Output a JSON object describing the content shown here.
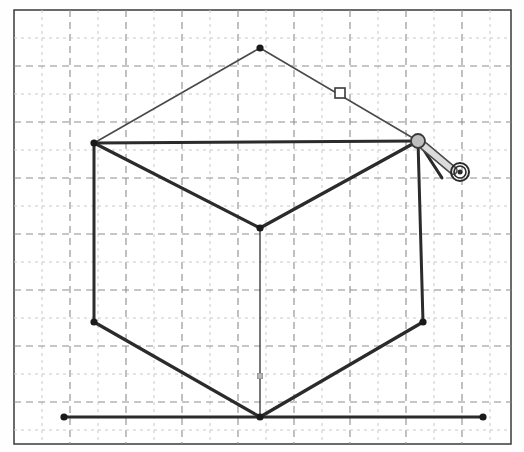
{
  "app": {
    "title": "Isometric Cube Sketch",
    "background_color": "#fefefe",
    "width": 524,
    "height": 452
  },
  "frame": {
    "name": "drawing-frame",
    "x": 14,
    "y": 10,
    "width": 497,
    "height": 434,
    "border_color": "#3a3a3a",
    "border_width": 1.5,
    "fill": "#ffffff"
  },
  "grid": {
    "minor_spacing": 28,
    "major_spacing": 56,
    "minor_color": "#c9c9c9",
    "major_color": "#8d8d8d",
    "minor_dash": "3 4",
    "major_dash": "7 5",
    "visible": true
  },
  "colors": {
    "stroke_heavy": "#2b2b2b",
    "stroke_light": "#4a4a4a",
    "vertex_fill": "#1a1a1a",
    "handle_fill": "#ffffff",
    "handle_stroke": "#3a3a3a",
    "cursor_body": "#dcdcdc",
    "cursor_outline": "#4a4a4a",
    "midpoint_marker": "#9a9a9a"
  },
  "chart_data": {
    "type": "scatter",
    "xlabel": "",
    "ylabel": "",
    "xlim": [
      0,
      524
    ],
    "ylim": [
      0,
      452
    ],
    "grid": true,
    "legend": "none",
    "vertices": [
      {
        "id": "apex",
        "label": "Top Apex",
        "x": 260,
        "y": 48,
        "dot": true
      },
      {
        "id": "left",
        "label": "Left Upper",
        "x": 94,
        "y": 143,
        "dot": true
      },
      {
        "id": "right",
        "label": "Right Upper",
        "x": 418,
        "y": 141,
        "dot": true
      },
      {
        "id": "center",
        "label": "Center Front",
        "x": 260,
        "y": 228,
        "dot": true
      },
      {
        "id": "bottom-left",
        "label": "Bottom Left",
        "x": 94,
        "y": 322,
        "dot": true
      },
      {
        "id": "bottom-right",
        "label": "Bottom Right",
        "x": 423,
        "y": 322,
        "dot": true
      },
      {
        "id": "bottom-center",
        "label": "Bottom Center",
        "x": 260,
        "y": 417,
        "dot": true
      },
      {
        "id": "base-left",
        "label": "Baseline Left",
        "x": 64,
        "y": 417,
        "dot": true
      },
      {
        "id": "base-right",
        "label": "Baseline Right",
        "x": 483,
        "y": 417,
        "dot": true
      }
    ],
    "edges": [
      {
        "id": "apex-left",
        "from": "apex",
        "to": "left",
        "weight": "light",
        "width": 1.6
      },
      {
        "id": "apex-right",
        "from": "apex",
        "to": "right",
        "weight": "light",
        "width": 1.6
      },
      {
        "id": "left-right",
        "from": "left",
        "to": "right",
        "weight": "heavy",
        "width": 3.2
      },
      {
        "id": "left-center",
        "from": "left",
        "to": "center",
        "weight": "heavy",
        "width": 3.2
      },
      {
        "id": "right-center",
        "from": "right",
        "to": "center",
        "weight": "heavy",
        "width": 3.2
      },
      {
        "id": "left-bottomleft",
        "from": "left",
        "to": "bottom-left",
        "weight": "heavy",
        "width": 3.0
      },
      {
        "id": "right-bottomright",
        "from": "right",
        "to": "bottom-right",
        "weight": "heavy",
        "width": 3.0
      },
      {
        "id": "center-bottomcenter",
        "from": "center",
        "to": "bottom-center",
        "weight": "light",
        "width": 1.5
      },
      {
        "id": "bottomleft-bottomcenter",
        "from": "bottom-left",
        "to": "bottom-center",
        "weight": "heavy",
        "width": 3.2
      },
      {
        "id": "bottomright-bottomcenter",
        "from": "bottom-right",
        "to": "bottom-center",
        "weight": "heavy",
        "width": 3.2
      },
      {
        "id": "baseline",
        "from": "base-left",
        "to": "base-right",
        "weight": "heavy",
        "width": 3.0
      }
    ]
  },
  "handles": {
    "edge_handle": {
      "name": "edge-midpoint-handle",
      "x": 340,
      "y": 93,
      "size": 10,
      "shape": "square",
      "state": "unselected"
    },
    "vertical_marker": {
      "name": "vertical-edge-marker",
      "x": 260,
      "y": 376,
      "size": 5,
      "shape": "square",
      "state": "dimmed"
    }
  },
  "cursor": {
    "name": "rotate-drag-cursor",
    "anchor_x": 418,
    "anchor_y": 141,
    "pivot_radius": 7,
    "arm_angle_deg": 40,
    "arm_length": 46,
    "pointer_length": 44,
    "pointer_angle_deg": 57,
    "target_x": 460,
    "target_y": 172,
    "target_outer_r": 9,
    "target_mid_r": 6,
    "target_inner_r": 2.5,
    "tooltip": "Rotate / drag vertex"
  }
}
